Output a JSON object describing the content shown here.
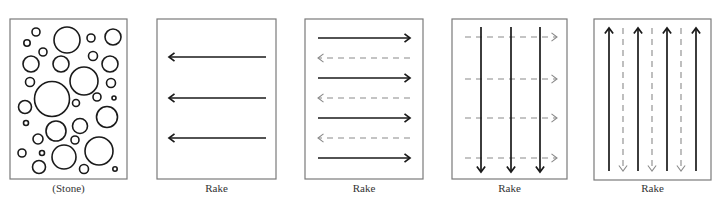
{
  "figure": {
    "panels": [
      {
        "id": "stone",
        "label": "(Stone)",
        "frame": {
          "x": 10,
          "y": 19,
          "w": 117,
          "h": 160
        },
        "content": "circles",
        "circles": [
          {
            "cx": 36,
            "cy": 32,
            "r": 4
          },
          {
            "cx": 27,
            "cy": 43,
            "r": 3.2
          },
          {
            "cx": 67,
            "cy": 40,
            "r": 13
          },
          {
            "cx": 91,
            "cy": 38,
            "r": 4
          },
          {
            "cx": 113,
            "cy": 37,
            "r": 8
          },
          {
            "cx": 43,
            "cy": 52,
            "r": 4
          },
          {
            "cx": 31,
            "cy": 64,
            "r": 8
          },
          {
            "cx": 61,
            "cy": 64,
            "r": 8
          },
          {
            "cx": 93,
            "cy": 56,
            "r": 4.5
          },
          {
            "cx": 110,
            "cy": 64,
            "r": 8
          },
          {
            "cx": 84,
            "cy": 81,
            "r": 14
          },
          {
            "cx": 30,
            "cy": 82,
            "r": 4.5
          },
          {
            "cx": 111,
            "cy": 83,
            "r": 4.5
          },
          {
            "cx": 52,
            "cy": 99,
            "r": 17.5
          },
          {
            "cx": 97,
            "cy": 97,
            "r": 4
          },
          {
            "cx": 114,
            "cy": 98,
            "r": 2
          },
          {
            "cx": 76,
            "cy": 103,
            "r": 3.5
          },
          {
            "cx": 25,
            "cy": 107,
            "r": 6.5
          },
          {
            "cx": 107,
            "cy": 117,
            "r": 10.5
          },
          {
            "cx": 26,
            "cy": 123,
            "r": 2.5
          },
          {
            "cx": 80,
            "cy": 126,
            "r": 7.5
          },
          {
            "cx": 56,
            "cy": 131,
            "r": 10
          },
          {
            "cx": 38,
            "cy": 139,
            "r": 5
          },
          {
            "cx": 75,
            "cy": 140,
            "r": 4
          },
          {
            "cx": 22,
            "cy": 153,
            "r": 4
          },
          {
            "cx": 42,
            "cy": 153,
            "r": 2.5
          },
          {
            "cx": 64,
            "cy": 157,
            "r": 12
          },
          {
            "cx": 99,
            "cy": 151,
            "r": 14
          },
          {
            "cx": 39,
            "cy": 167,
            "r": 6.5
          },
          {
            "cx": 84,
            "cy": 169,
            "r": 4.5
          },
          {
            "cx": 115,
            "cy": 169,
            "r": 2.2
          }
        ]
      },
      {
        "id": "rake-1",
        "label": "Rake",
        "frame": {
          "x": 157,
          "y": 19,
          "w": 119,
          "h": 160
        },
        "content": "arrows",
        "arrows": [
          {
            "x1": 266,
            "y1": 57,
            "x2": 169,
            "y2": 57,
            "dir": "left",
            "style": "solid"
          },
          {
            "x1": 266,
            "y1": 98,
            "x2": 169,
            "y2": 98,
            "dir": "left",
            "style": "solid"
          },
          {
            "x1": 266,
            "y1": 138,
            "x2": 169,
            "y2": 138,
            "dir": "left",
            "style": "solid"
          }
        ]
      },
      {
        "id": "rake-2",
        "label": "Rake",
        "frame": {
          "x": 305,
          "y": 19,
          "w": 118,
          "h": 160
        },
        "content": "arrows",
        "arrows": [
          {
            "x1": 318,
            "y1": 38,
            "x2": 410,
            "y2": 38,
            "dir": "right",
            "style": "solid"
          },
          {
            "x1": 410,
            "y1": 58,
            "x2": 318,
            "y2": 58,
            "dir": "left",
            "style": "dashed"
          },
          {
            "x1": 318,
            "y1": 78,
            "x2": 410,
            "y2": 78,
            "dir": "right",
            "style": "solid"
          },
          {
            "x1": 410,
            "y1": 98,
            "x2": 318,
            "y2": 98,
            "dir": "left",
            "style": "dashed"
          },
          {
            "x1": 318,
            "y1": 118,
            "x2": 410,
            "y2": 118,
            "dir": "right",
            "style": "solid"
          },
          {
            "x1": 410,
            "y1": 138,
            "x2": 318,
            "y2": 138,
            "dir": "left",
            "style": "dashed"
          },
          {
            "x1": 318,
            "y1": 158,
            "x2": 410,
            "y2": 158,
            "dir": "right",
            "style": "solid"
          }
        ]
      },
      {
        "id": "rake-3",
        "label": "Rake",
        "frame": {
          "x": 452,
          "y": 19,
          "w": 115,
          "h": 160
        },
        "content": "arrows",
        "arrows": [
          {
            "x1": 465,
            "y1": 37,
            "x2": 557,
            "y2": 37,
            "dir": "right",
            "style": "dashed"
          },
          {
            "x1": 465,
            "y1": 79,
            "x2": 557,
            "y2": 79,
            "dir": "right",
            "style": "dashed"
          },
          {
            "x1": 465,
            "y1": 118,
            "x2": 557,
            "y2": 118,
            "dir": "right",
            "style": "dashed"
          },
          {
            "x1": 465,
            "y1": 158,
            "x2": 557,
            "y2": 158,
            "dir": "right",
            "style": "dashed"
          },
          {
            "x1": 481,
            "y1": 27,
            "x2": 481,
            "y2": 172,
            "dir": "down",
            "style": "solid"
          },
          {
            "x1": 511,
            "y1": 27,
            "x2": 511,
            "y2": 172,
            "dir": "down",
            "style": "solid"
          },
          {
            "x1": 540,
            "y1": 27,
            "x2": 540,
            "y2": 172,
            "dir": "down",
            "style": "solid"
          }
        ]
      },
      {
        "id": "rake-4",
        "label": "Rake",
        "frame": {
          "x": 594,
          "y": 19,
          "w": 117,
          "h": 161
        },
        "content": "arrows",
        "arrows": [
          {
            "x1": 609,
            "y1": 171,
            "x2": 609,
            "y2": 28,
            "dir": "up",
            "style": "solid"
          },
          {
            "x1": 623,
            "y1": 28,
            "x2": 623,
            "y2": 171,
            "dir": "down",
            "style": "dashed"
          },
          {
            "x1": 638,
            "y1": 171,
            "x2": 638,
            "y2": 28,
            "dir": "up",
            "style": "solid"
          },
          {
            "x1": 652,
            "y1": 28,
            "x2": 652,
            "y2": 171,
            "dir": "down",
            "style": "dashed"
          },
          {
            "x1": 667,
            "y1": 171,
            "x2": 667,
            "y2": 28,
            "dir": "up",
            "style": "solid"
          },
          {
            "x1": 681,
            "y1": 28,
            "x2": 681,
            "y2": 171,
            "dir": "down",
            "style": "dashed"
          },
          {
            "x1": 696,
            "y1": 171,
            "x2": 696,
            "y2": 28,
            "dir": "up",
            "style": "solid"
          }
        ]
      }
    ],
    "label_y": 192,
    "colors": {
      "frame": "#7a7a7a",
      "solid_stroke": "#1a1a1a",
      "dashed_stroke": "#8a8a8a",
      "label": "#333333",
      "background": "#ffffff"
    }
  }
}
